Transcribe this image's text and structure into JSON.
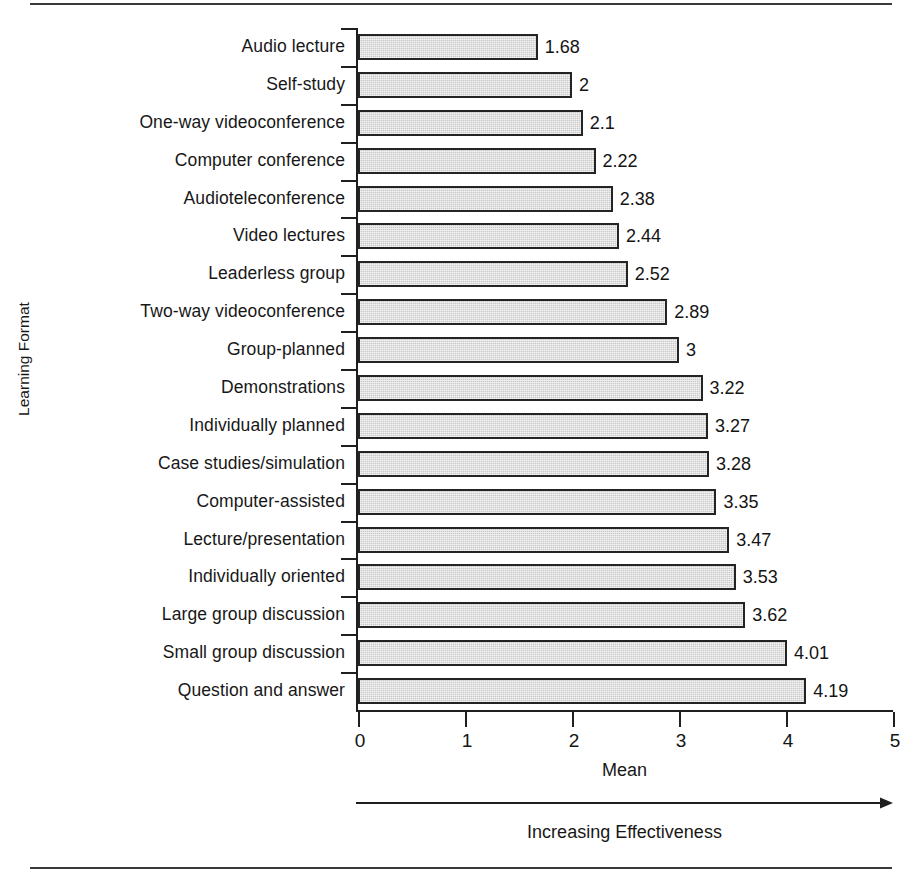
{
  "chart_data": {
    "type": "bar",
    "orientation": "horizontal",
    "title": "",
    "xlabel": "Mean",
    "ylabel": "Learning Format",
    "xlim": [
      0,
      5
    ],
    "xticks": [
      "0",
      "1",
      "2",
      "3",
      "4",
      "5"
    ],
    "grid": false,
    "legend": null,
    "bar_color": "#c9c9c9",
    "bar_border_color": "#242424",
    "annotation": "Increasing Effectiveness",
    "categories": [
      "Audio lecture",
      "Self-study",
      "One-way videoconference",
      "Computer conference",
      "Audioteleconference",
      "Video lectures",
      "Leaderless group",
      "Two-way videoconference",
      "Group-planned",
      "Demonstrations",
      "Individually planned",
      "Case studies/simulation",
      "Computer-assisted",
      "Lecture/presentation",
      "Individually oriented",
      "Large group discussion",
      "Small group discussion",
      "Question and answer"
    ],
    "values": [
      1.68,
      2,
      2.1,
      2.22,
      2.38,
      2.44,
      2.52,
      2.89,
      3,
      3.22,
      3.27,
      3.28,
      3.35,
      3.47,
      3.53,
      3.62,
      4.01,
      4.19
    ],
    "value_labels": [
      "1.68",
      "2",
      "2.1",
      "2.22",
      "2.38",
      "2.44",
      "2.52",
      "2.89",
      "3",
      "3.22",
      "3.27",
      "3.28",
      "3.35",
      "3.47",
      "3.53",
      "3.62",
      "4.01",
      "4.19"
    ]
  }
}
